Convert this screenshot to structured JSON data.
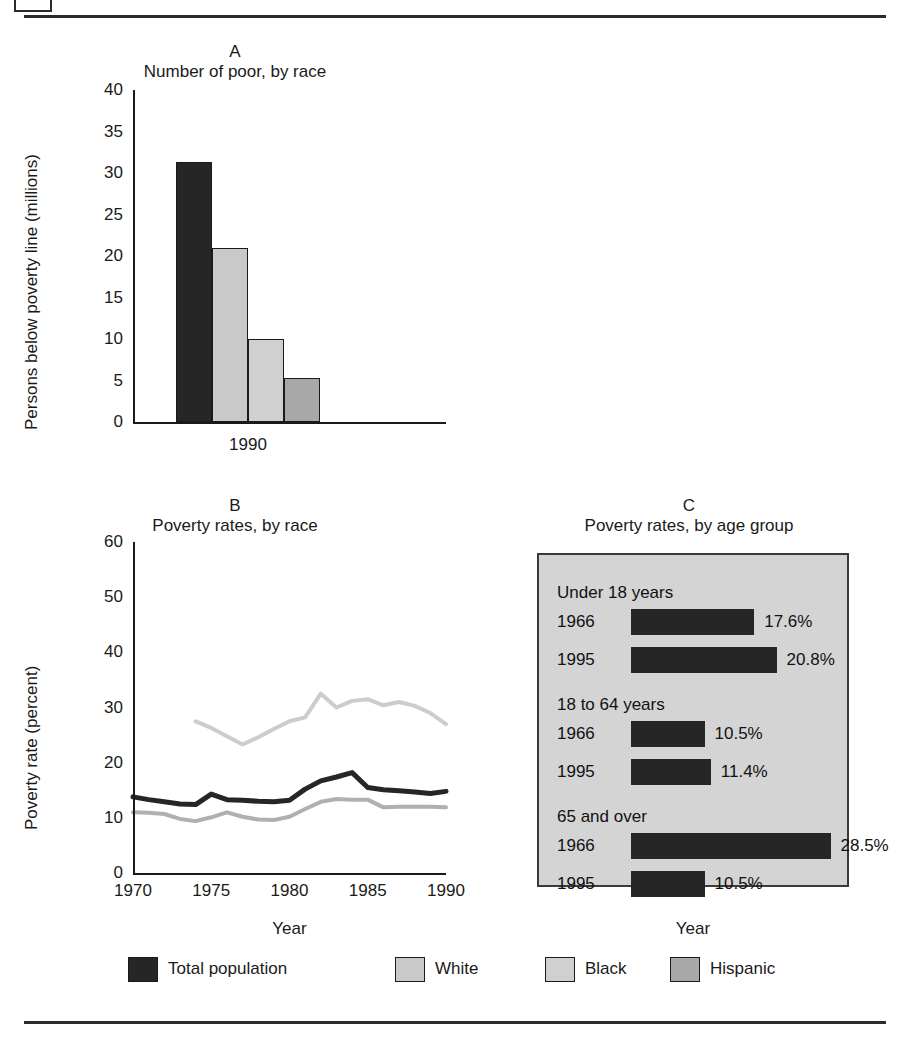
{
  "figure": {
    "top_rule": true,
    "bottom_rule": true,
    "header_icon": "page-corner-icon"
  },
  "colors": {
    "total_population": "#262626",
    "white": "#c9c9c9",
    "black": "#d0d0d0",
    "hispanic": "#a8a8a8",
    "panel_c_background": "#d4d4d4",
    "axis": "#1a1a1a"
  },
  "legend": {
    "items": [
      {
        "label": "Total population",
        "color": "#262626"
      },
      {
        "label": "White",
        "color": "#c9c9c9"
      },
      {
        "label": "Black",
        "color": "#d0d0d0"
      },
      {
        "label": "Hispanic",
        "color": "#a8a8a8"
      }
    ]
  },
  "panels": {
    "a": {
      "letter": "A",
      "title": "Number of poor, by race"
    },
    "b": {
      "letter": "B",
      "title": "Poverty rates, by race"
    },
    "c": {
      "letter": "C",
      "title": "Poverty rates, by age group"
    }
  },
  "chart_data": [
    {
      "type": "bar",
      "id": "panel-a",
      "title": "Number of poor, by race",
      "panel_letter": "A",
      "xlabel": "",
      "ylabel": "Persons below poverty line (millions)",
      "ylim": [
        0,
        40
      ],
      "yticks": [
        0,
        5,
        10,
        15,
        20,
        25,
        30,
        35,
        40
      ],
      "ytick_labels": [
        "0",
        "5",
        "10",
        "15",
        "20",
        "25",
        "30",
        "35",
        "40"
      ],
      "categories": [
        "1990"
      ],
      "xtick_labels": [
        "1990"
      ],
      "grid": false,
      "legend_position": "bottom-shared",
      "series": [
        {
          "name": "Total population",
          "values": [
            31.3
          ],
          "color": "#262626"
        },
        {
          "name": "White",
          "values": [
            21.0
          ],
          "color": "#c9c9c9"
        },
        {
          "name": "Black",
          "values": [
            10.0
          ],
          "color": "#d0d0d0"
        },
        {
          "name": "Hispanic",
          "values": [
            5.3
          ],
          "color": "#a8a8a8"
        }
      ]
    },
    {
      "type": "line",
      "id": "panel-b",
      "title": "Poverty rates, by race",
      "panel_letter": "B",
      "xlabel": "Year",
      "ylabel": "Poverty rate (percent)",
      "xlim": [
        1970,
        1990
      ],
      "ylim": [
        0,
        60
      ],
      "yticks": [
        0,
        10,
        20,
        30,
        40,
        50,
        60
      ],
      "ytick_labels": [
        "0",
        "10",
        "20",
        "30",
        "40",
        "50",
        "60"
      ],
      "xticks": [
        1970,
        1975,
        1980,
        1985,
        1990
      ],
      "xtick_labels": [
        "1970",
        "1975",
        "1980",
        "1985",
        "1990"
      ],
      "grid": false,
      "legend_position": "bottom-shared",
      "series": [
        {
          "name": "Total population",
          "color": "#262626",
          "x": [
            1970,
            1971,
            1972,
            1973,
            1974,
            1975,
            1976,
            1977,
            1978,
            1979,
            1980,
            1981,
            1982,
            1983,
            1984,
            1985,
            1986,
            1987,
            1988,
            1989,
            1990
          ],
          "values": [
            13.8,
            13.3,
            12.9,
            12.5,
            12.4,
            14.3,
            13.3,
            13.2,
            13.0,
            12.9,
            13.2,
            15.2,
            16.7,
            17.4,
            18.2,
            15.5,
            15.1,
            14.9,
            14.7,
            14.4,
            14.8
          ]
        },
        {
          "name": "White",
          "color": "#b0b0b0",
          "x": [
            1970,
            1971,
            1972,
            1973,
            1974,
            1975,
            1976,
            1977,
            1978,
            1979,
            1980,
            1981,
            1982,
            1983,
            1984,
            1985,
            1986,
            1987,
            1988,
            1989,
            1990
          ],
          "values": [
            11.0,
            10.9,
            10.7,
            9.8,
            9.4,
            10.1,
            11.0,
            10.2,
            9.7,
            9.6,
            10.2,
            11.6,
            12.9,
            13.4,
            13.3,
            13.3,
            11.9,
            12.0,
            12.0,
            12.0,
            11.9
          ]
        },
        {
          "name": "Black",
          "color": "#cccccc",
          "x": [
            1974,
            1975,
            1976,
            1977,
            1978,
            1979,
            1980,
            1981,
            1982,
            1983,
            1984,
            1985,
            1986,
            1987,
            1988,
            1989,
            1990
          ],
          "values": [
            27.5,
            26.3,
            24.8,
            23.3,
            24.6,
            26.1,
            27.5,
            28.2,
            32.5,
            30.0,
            31.2,
            31.5,
            30.4,
            31.0,
            30.3,
            29.0,
            27.0
          ]
        }
      ]
    },
    {
      "type": "bar",
      "id": "panel-c",
      "orientation": "horizontal",
      "title": "Poverty rates, by age group",
      "panel_letter": "C",
      "xlabel": "Year",
      "ylabel": "",
      "grid": false,
      "background": "#d4d4d4",
      "groups": [
        {
          "label": "Under 18 years",
          "bars": [
            {
              "year": "1966",
              "value": 17.6,
              "value_label": "17.6%"
            },
            {
              "year": "1995",
              "value": 20.8,
              "value_label": "20.8%"
            }
          ]
        },
        {
          "label": "18 to 64 years",
          "bars": [
            {
              "year": "1966",
              "value": 10.5,
              "value_label": "10.5%"
            },
            {
              "year": "1995",
              "value": 11.4,
              "value_label": "11.4%"
            }
          ]
        },
        {
          "label": "65 and over",
          "bars": [
            {
              "year": "1966",
              "value": 28.5,
              "value_label": "28.5%"
            },
            {
              "year": "1995",
              "value": 10.5,
              "value_label": "10.5%"
            }
          ]
        }
      ]
    }
  ]
}
